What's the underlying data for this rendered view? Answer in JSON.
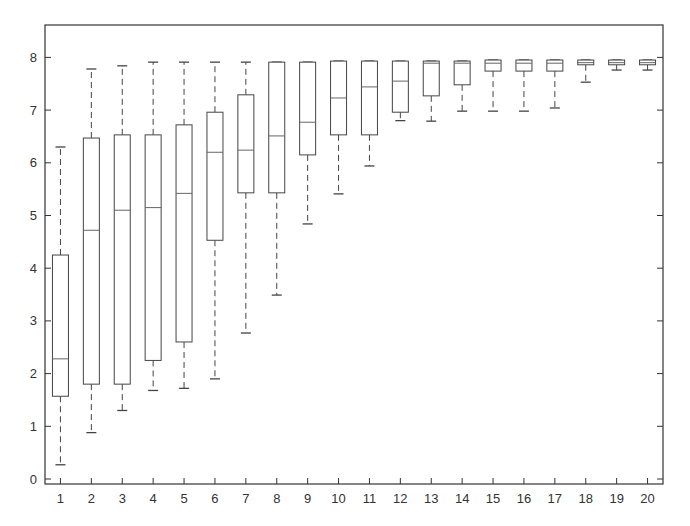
{
  "chart_data": {
    "type": "boxplot",
    "title": "",
    "xlabel": "",
    "ylabel": "",
    "categories": [
      "1",
      "2",
      "3",
      "4",
      "5",
      "6",
      "7",
      "8",
      "9",
      "10",
      "11",
      "12",
      "13",
      "14",
      "15",
      "16",
      "17",
      "18",
      "19",
      "20"
    ],
    "ylim": [
      -0.15,
      8.6
    ],
    "yticks": [
      0,
      1,
      2,
      3,
      4,
      5,
      6,
      7,
      8
    ],
    "grid": false,
    "legend": null,
    "boxes": [
      {
        "label": "1",
        "whisker_low": 0.27,
        "q1": 1.57,
        "median": 2.28,
        "q3": 4.25,
        "whisker_high": 6.3
      },
      {
        "label": "2",
        "whisker_low": 0.88,
        "q1": 1.8,
        "median": 4.72,
        "q3": 6.47,
        "whisker_high": 7.78
      },
      {
        "label": "3",
        "whisker_low": 1.3,
        "q1": 1.8,
        "median": 5.1,
        "q3": 6.53,
        "whisker_high": 7.84
      },
      {
        "label": "4",
        "whisker_low": 1.68,
        "q1": 2.25,
        "median": 5.15,
        "q3": 6.53,
        "whisker_high": 7.91
      },
      {
        "label": "5",
        "whisker_low": 1.72,
        "q1": 2.6,
        "median": 5.42,
        "q3": 6.72,
        "whisker_high": 7.91
      },
      {
        "label": "6",
        "whisker_low": 1.9,
        "q1": 4.53,
        "median": 6.2,
        "q3": 6.96,
        "whisker_high": 7.91
      },
      {
        "label": "7",
        "whisker_low": 2.77,
        "q1": 5.43,
        "median": 6.24,
        "q3": 7.29,
        "whisker_high": 7.91
      },
      {
        "label": "8",
        "whisker_low": 3.49,
        "q1": 5.43,
        "median": 6.51,
        "q3": 7.91,
        "whisker_high": 7.91
      },
      {
        "label": "9",
        "whisker_low": 4.84,
        "q1": 6.15,
        "median": 6.77,
        "q3": 7.91,
        "whisker_high": 7.91
      },
      {
        "label": "10",
        "whisker_low": 5.41,
        "q1": 6.53,
        "median": 7.23,
        "q3": 7.93,
        "whisker_high": 7.93
      },
      {
        "label": "11",
        "whisker_low": 5.94,
        "q1": 6.53,
        "median": 7.44,
        "q3": 7.93,
        "whisker_high": 7.93
      },
      {
        "label": "12",
        "whisker_low": 6.8,
        "q1": 6.96,
        "median": 7.55,
        "q3": 7.93,
        "whisker_high": 7.93
      },
      {
        "label": "13",
        "whisker_low": 6.79,
        "q1": 7.27,
        "median": 7.89,
        "q3": 7.93,
        "whisker_high": 7.93
      },
      {
        "label": "14",
        "whisker_low": 6.98,
        "q1": 7.48,
        "median": 7.89,
        "q3": 7.93,
        "whisker_high": 7.93
      },
      {
        "label": "15",
        "whisker_low": 6.98,
        "q1": 7.74,
        "median": 7.89,
        "q3": 7.95,
        "whisker_high": 7.95
      },
      {
        "label": "16",
        "whisker_low": 6.98,
        "q1": 7.74,
        "median": 7.89,
        "q3": 7.95,
        "whisker_high": 7.95
      },
      {
        "label": "17",
        "whisker_low": 7.04,
        "q1": 7.74,
        "median": 7.89,
        "q3": 7.95,
        "whisker_high": 7.95
      },
      {
        "label": "18",
        "whisker_low": 7.53,
        "q1": 7.86,
        "median": 7.9,
        "q3": 7.95,
        "whisker_high": 7.95
      },
      {
        "label": "19",
        "whisker_low": 7.76,
        "q1": 7.86,
        "median": 7.9,
        "q3": 7.95,
        "whisker_high": 7.95
      },
      {
        "label": "20",
        "whisker_low": 7.76,
        "q1": 7.86,
        "median": 7.9,
        "q3": 7.95,
        "whisker_high": 7.95
      }
    ],
    "colors": {
      "axis": "#333333",
      "box": "#444444",
      "median": "#666666",
      "whisker": "#444444"
    }
  }
}
